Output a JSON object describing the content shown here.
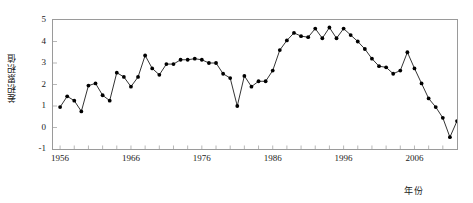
{
  "chart_data": {
    "type": "line",
    "title": "",
    "xlabel": "年份",
    "ylabel": "差积累积值",
    "xlim": [
      1955,
      2012
    ],
    "ylim": [
      -1,
      5
    ],
    "grid": false,
    "legend": null,
    "marker": "filled-circle",
    "line_color": "#000000",
    "marker_color": "#000000",
    "axis_color": "#9a9a9a",
    "xticks": [
      "1956",
      "1966",
      "1976",
      "1986",
      "1996",
      "2006"
    ],
    "xtick_values": [
      1956,
      1966,
      1976,
      1986,
      1996,
      2006
    ],
    "xminor_tick_interval": 2,
    "yticks": [
      "-1",
      "0",
      "1",
      "2",
      "3",
      "4",
      "5"
    ],
    "ytick_values": [
      -1,
      0,
      1,
      2,
      3,
      4,
      5
    ],
    "x": [
      1956,
      1957,
      1958,
      1959,
      1960,
      1961,
      1962,
      1963,
      1964,
      1965,
      1966,
      1967,
      1968,
      1969,
      1970,
      1971,
      1972,
      1973,
      1974,
      1975,
      1976,
      1977,
      1978,
      1979,
      1980,
      1981,
      1982,
      1983,
      1984,
      1985,
      1986,
      1987,
      1988,
      1989,
      1990,
      1991,
      1992,
      1993,
      1994,
      1995,
      1996,
      1997,
      1998,
      1999,
      2000,
      2001,
      2002,
      2003,
      2004,
      2005,
      2006,
      2007,
      2008,
      2009,
      2010,
      2011
    ],
    "values": [
      0.95,
      1.45,
      1.25,
      0.75,
      1.95,
      2.05,
      1.5,
      1.25,
      2.55,
      2.35,
      1.9,
      2.35,
      3.35,
      2.75,
      2.45,
      2.95,
      2.95,
      3.15,
      3.15,
      3.2,
      3.15,
      3.0,
      3.0,
      2.5,
      2.3,
      1.0,
      2.4,
      1.9,
      2.15,
      2.15,
      2.65,
      3.6,
      4.05,
      4.4,
      4.25,
      4.2,
      4.6,
      4.15,
      4.65,
      4.15,
      4.6,
      4.3,
      4.0,
      3.65,
      3.2,
      2.85,
      2.8,
      2.5,
      2.65,
      3.5,
      2.75,
      2.05,
      1.35,
      0.95,
      0.45,
      -0.45
    ],
    "last_value_rebound": 0.3
  },
  "axes": {
    "x_axis_label": "年份",
    "y_axis_label": "差积累积值"
  }
}
